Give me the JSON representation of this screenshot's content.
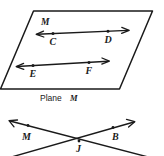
{
  "figure": {
    "stroke_color": "#1a1a1a",
    "background_color": "#ffffff",
    "upper": {
      "plane_label": "M",
      "caption_prefix": "Plane",
      "caption_label": "M",
      "lines": [
        {
          "name": "line-CD",
          "points": [
            {
              "label": "C"
            },
            {
              "label": "D"
            }
          ]
        },
        {
          "name": "line-EF",
          "points": [
            {
              "label": "E"
            },
            {
              "label": "F"
            }
          ]
        }
      ]
    },
    "lower": {
      "labels": [
        {
          "name": "label-M",
          "text": "M"
        },
        {
          "name": "label-B",
          "text": "B"
        },
        {
          "name": "label-J",
          "text": "J"
        }
      ]
    }
  }
}
